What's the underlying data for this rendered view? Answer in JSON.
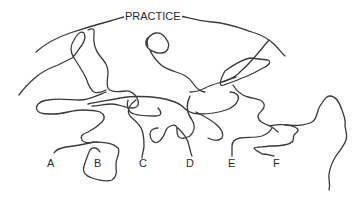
{
  "diagram": {
    "type": "tangled-lines-puzzle",
    "title": "PRACTICE",
    "line_color": "#3a3a3a",
    "background": "#ffffff",
    "start_labels": [
      {
        "id": "A",
        "label": "A"
      },
      {
        "id": "B",
        "label": "B"
      },
      {
        "id": "C",
        "label": "C"
      },
      {
        "id": "D",
        "label": "D"
      },
      {
        "id": "E",
        "label": "E"
      },
      {
        "id": "F",
        "label": "F"
      }
    ]
  }
}
